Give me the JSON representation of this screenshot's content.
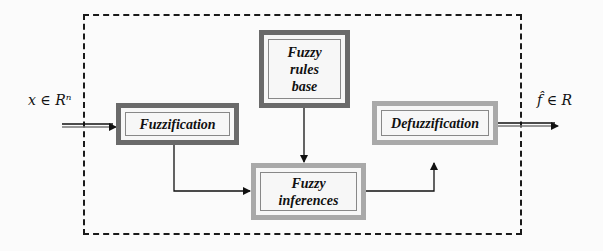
{
  "diagram": {
    "input_label": "x ∈ Rⁿ",
    "output_label": "f̂ ∈ R",
    "blocks": [
      {
        "id": "fuzzification",
        "label": "Fuzzification"
      },
      {
        "id": "rules",
        "label_lines": [
          "Fuzzy",
          "rules",
          "base"
        ]
      },
      {
        "id": "inferences",
        "label_lines": [
          "Fuzzy",
          "inferences"
        ]
      },
      {
        "id": "defuzzification",
        "label": "Defuzzification"
      }
    ],
    "edges": [
      {
        "from": "input",
        "to": "fuzzification"
      },
      {
        "from": "fuzzification",
        "to": "inferences"
      },
      {
        "from": "rules",
        "to": "inferences"
      },
      {
        "from": "inferences",
        "to": "defuzzification"
      },
      {
        "from": "defuzzification",
        "to": "output"
      }
    ],
    "colors": {
      "dark_border": "#6a6a6a",
      "light_border": "#a9a9a9",
      "line": "#111111"
    }
  }
}
